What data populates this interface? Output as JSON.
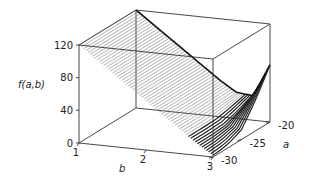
{
  "chart_data": {
    "type": "surface3d",
    "title": "",
    "zlabel": "f(a,b)",
    "xlabel": "b",
    "ylabel": "a",
    "xlim": [
      1,
      3
    ],
    "ylim": [
      -30,
      -20
    ],
    "zlim": [
      0,
      120
    ],
    "xticks": [
      "1",
      "2",
      "3"
    ],
    "yticks": [
      "-20",
      "-25",
      "-30"
    ],
    "zticks": [
      "0",
      "40",
      "80",
      "120"
    ],
    "xtick_values": [
      1,
      2,
      3
    ],
    "ytick_values": [
      -20,
      -25,
      -30
    ],
    "ztick_values": [
      0,
      40,
      80,
      120
    ],
    "surface": {
      "description": "f(a,b) linear-to-quadratic valley surface; high (~120) at b=1, falling to ~0 near b≈2.6–3, rising steeply along the a=-20 edge near b=3",
      "b_samples": [
        1.0,
        1.25,
        1.5,
        1.75,
        2.0,
        2.25,
        2.5,
        2.75,
        3.0
      ],
      "a_samples": [
        -30,
        -27.5,
        -25,
        -22.5,
        -20
      ],
      "z_grid": [
        [
          120,
          105,
          90,
          75,
          60,
          45,
          30,
          15,
          2
        ],
        [
          120,
          105,
          90,
          75,
          60,
          45,
          30,
          15,
          4
        ],
        [
          120,
          105,
          90,
          75,
          60,
          45,
          30,
          16,
          12
        ],
        [
          120,
          105,
          90,
          75,
          60,
          45,
          31,
          22,
          38
        ],
        [
          120,
          105,
          90,
          75,
          60,
          45,
          32,
          30,
          70
        ]
      ]
    },
    "grid": false,
    "legend": "none"
  }
}
